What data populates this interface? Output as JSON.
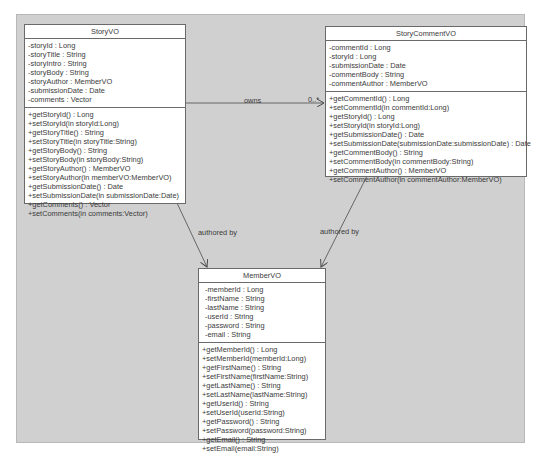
{
  "diagram": {
    "type": "UML class diagram",
    "classes": [
      {
        "id": "story-vo",
        "name": "StoryVO",
        "attributes": [
          "-storyId : Long",
          "-storyTitle : String",
          "-storyIntro : String",
          "-storyBody : String",
          "-storyAuthor : MemberVO",
          "-submissionDate : Date",
          "-comments : Vector"
        ],
        "operations": [
          "+getStoryId() : Long",
          "+setStoryId(in storyId:Long)",
          "+getStoryTitle() : String",
          "+setStoryTitle(in storyTitle:String)",
          "+getStoryBody() : String",
          "+setStoryBody(in storyBody:String)",
          "+getStoryAuthor() : MemberVO",
          "+setStoryAuthor(in memberVO:MemberVO)",
          "+getSubmissionDate() : Date",
          "+setSubmissionDate(in submissionDate:Date)",
          "+getComments() : Vector",
          "+setComments(in comments:Vector)"
        ]
      },
      {
        "id": "story-comment-vo",
        "name": "StoryCommentVO",
        "attributes": [
          "-commentId : Long",
          "-storyId : Long",
          "-submissionDate : Date",
          "-commentBody : String",
          "-commentAuthor : MemberVO"
        ],
        "operations": [
          "+getCommentId() : Long",
          "+setCommentId(in commentId:Long)",
          "+getStoryId() : Long",
          "+setStoryId(in storyId:Long)",
          "+getSubmissionDate() : Date",
          "+setSubmissionDate(submissionDate:submissionDate) : Date",
          "+getCommentBody() : String",
          "+setCommentBody(in commentBody:String)",
          "+getCommentAuthor() : MemberVO",
          "+setCommentAuthor(in commentAuthor:MemberVO)"
        ]
      },
      {
        "id": "member-vo",
        "name": "MemberVO",
        "attributes": [
          "-memberId : Long",
          "-firstName : String",
          "-lastName : String",
          "-userId : String",
          "-password : String",
          "-email : String"
        ],
        "operations": [
          "+getMemberId() : Long",
          "+setMemberId(memberId:Long)",
          "+getFirstName() : String",
          "+setFirstName(firstName:String)",
          "+getLastName() : String",
          "+setLastName(lastName:String)",
          "+getUserId() : String",
          "+setUserId(userId:String)",
          "+getPassword() : String",
          "+setPassword(password:String)",
          "+getEmail() : String",
          "+setEmail(email:String)"
        ]
      }
    ],
    "associations": [
      {
        "from": "StoryVO",
        "to": "StoryCommentVO",
        "label": "owns",
        "multiplicity": "0..*"
      },
      {
        "from": "StoryVO",
        "to": "MemberVO",
        "label": "authored by"
      },
      {
        "from": "StoryCommentVO",
        "to": "MemberVO",
        "label": "authored by"
      }
    ]
  },
  "colors": {
    "frame_bg": "#d0d0d0",
    "box_bg": "#ffffff",
    "line": "#5a5a5a",
    "text": "#3a3a3a"
  }
}
